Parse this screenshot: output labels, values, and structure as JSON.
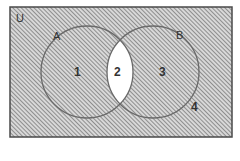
{
  "diagram": {
    "type": "venn",
    "universe_label": "U",
    "sets": [
      {
        "label": "A"
      },
      {
        "label": "B"
      }
    ],
    "regions": [
      {
        "label": "1",
        "shaded": true
      },
      {
        "label": "2",
        "shaded": false
      },
      {
        "label": "3",
        "shaded": true
      },
      {
        "label": "4",
        "shaded": true
      }
    ],
    "colors": {
      "hatch": "#6e6e6e",
      "border": "#4a4a4a",
      "background": "#ffffff"
    }
  }
}
